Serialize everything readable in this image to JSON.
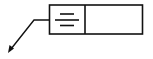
{
  "diagram": {
    "type": "feature-control-frame",
    "symbol": "symmetry",
    "tolerance_cell_text": "",
    "stroke_color": "#111111",
    "background_color": "#ffffff",
    "leader": {
      "arrow": true,
      "direction": "down-left"
    }
  }
}
